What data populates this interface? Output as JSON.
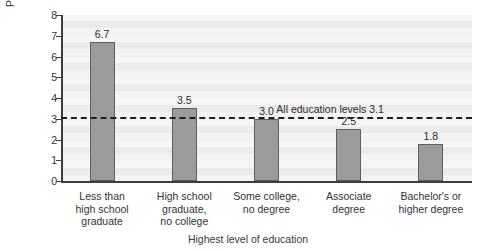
{
  "chart_data": {
    "type": "bar",
    "title": "",
    "xlabel": "Highest level of education",
    "ylabel": "Percent unemployed",
    "categories": [
      "Less than\nhigh school\ngraduate",
      "High school\ngraduate,\nno college",
      "Some college,\nno degree",
      "Associate\ndegree",
      "Bachelor's or\nhigher degree"
    ],
    "values": [
      6.7,
      3.5,
      3.0,
      2.5,
      1.8
    ],
    "value_labels": [
      "6.7",
      "3.5",
      "3.0",
      "2.5",
      "1.8"
    ],
    "ylim": [
      0,
      8
    ],
    "yticks": [
      0,
      1,
      2,
      3,
      4,
      5,
      6,
      7,
      8
    ],
    "ytick_labels": [
      "0",
      "1",
      "2",
      "3",
      "4",
      "5",
      "6",
      "7",
      "8"
    ],
    "grid": false,
    "legend": null,
    "annotations": [
      {
        "name": "all-education-levels-reference",
        "text": "All education levels 3.1",
        "value": 3.1,
        "style": "dashed-horizontal-line"
      }
    ],
    "colors": {
      "bar_fill": "#9b9b9b",
      "bar_edge": "#5f5f5f",
      "plot_background": "#f1f1f1",
      "axis": "#3d3d3d",
      "reference_line": "#1f1f1f",
      "text": "#2b2b2b"
    }
  }
}
